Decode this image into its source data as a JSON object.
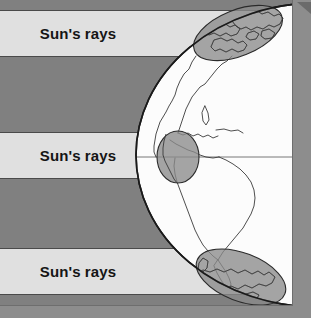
{
  "figure": {
    "width": 311,
    "height": 318,
    "background_color": "#808080",
    "border_color": "#9a9a9a"
  },
  "colors": {
    "shadow_dark": "#808080",
    "ray_band_light": "#e0e0e0",
    "globe_fill": "#fcfcfc",
    "globe_outline": "#1a1a1a",
    "footprint_fill": "#8a8a8a",
    "footprint_outline": "#2a2a2a",
    "coastline": "#3a3a3a",
    "band_edge": "#4a4a4a",
    "frame_gray": "#8d8d8d"
  },
  "ray_bands": [
    {
      "id": "north-ray-band",
      "label": "Sun's rays",
      "label_x": 78,
      "label_y": 39,
      "y": 10,
      "height": 47,
      "latitude_zone": "high-northern",
      "angle_of_incidence": "oblique"
    },
    {
      "id": "equator-ray-band",
      "label": "Sun's rays",
      "label_x": 78,
      "label_y": 161,
      "y": 132,
      "height": 47,
      "latitude_zone": "equatorial",
      "angle_of_incidence": "perpendicular"
    },
    {
      "id": "south-ray-band",
      "label": "Sun's rays",
      "label_x": 78,
      "label_y": 277,
      "y": 248,
      "height": 47,
      "latitude_zone": "high-southern",
      "angle_of_incidence": "oblique"
    }
  ],
  "globe": {
    "id": "earth-globe",
    "label": "Earth",
    "center_x": 318,
    "center_y": 155,
    "radius_x": 182,
    "radius_y": 152,
    "visible_region": "Americas"
  },
  "footprints": [
    {
      "id": "northern-footprint",
      "label": "Spread-out energy at high northern latitude",
      "cx": 238,
      "cy": 33,
      "rx": 47,
      "ry": 23,
      "rotation": -22
    },
    {
      "id": "equatorial-footprint",
      "label": "Concentrated energy at the equator",
      "cx": 178,
      "cy": 157,
      "rx": 21,
      "ry": 26,
      "rotation": 0
    },
    {
      "id": "southern-footprint",
      "label": "Spread-out energy at high southern latitude",
      "cx": 241,
      "cy": 277,
      "rx": 47,
      "ry": 24,
      "rotation": 21
    }
  ],
  "equator_line": {
    "id": "equator-line",
    "label": "Equator",
    "y": 157
  }
}
